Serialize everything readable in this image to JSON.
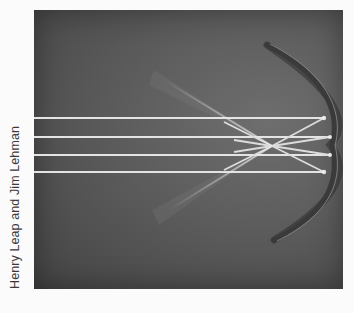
{
  "image": {
    "subject": "concave-mirror-reflecting-parallel-light-rays",
    "credit": "Henry Leap and Jim Lehman",
    "colors": {
      "background": "#fbfbfb",
      "photo_dark": "#444444",
      "photo_mid": "#5c5c5c",
      "ray": "#e6e6e6",
      "mirror": "#3a3a3a",
      "credit_text": "#3a3a3a"
    },
    "rays": {
      "count": 4,
      "incident_y": [
        108,
        127,
        145,
        162
      ]
    }
  }
}
